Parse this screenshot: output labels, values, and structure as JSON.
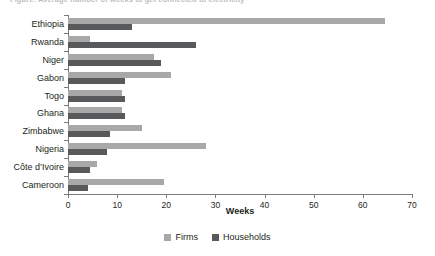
{
  "chart_data": {
    "type": "bar",
    "orientation": "horizontal",
    "title": "Figure: Average number of weeks to get connected to electricity",
    "xlabel": "Weeks",
    "ylabel": "",
    "xlim": [
      0,
      70
    ],
    "xticks": [
      0,
      10,
      20,
      30,
      40,
      50,
      60,
      70
    ],
    "grid": false,
    "legend_position": "bottom",
    "categories": [
      "Ethiopia",
      "Rwanda",
      "Niger",
      "Gabon",
      "Togo",
      "Ghana",
      "Zimbabwe",
      "Nigeria",
      "Côte d’Ivoire",
      "Cameroon"
    ],
    "series": [
      {
        "name": "Firms",
        "color": "#a8a8a8",
        "values": [
          64.5,
          4.5,
          17.5,
          21.0,
          11.0,
          11.0,
          15.0,
          28.0,
          6.0,
          19.5
        ]
      },
      {
        "name": "Households",
        "color": "#58595b",
        "values": [
          13.0,
          26.0,
          19.0,
          11.5,
          11.5,
          11.5,
          8.5,
          8.0,
          4.5,
          4.0
        ]
      }
    ]
  },
  "legend": [
    {
      "label": "Firms",
      "color": "#a8a8a8"
    },
    {
      "label": "Households",
      "color": "#58595b"
    }
  ],
  "axis": {
    "x_title": "Weeks"
  }
}
